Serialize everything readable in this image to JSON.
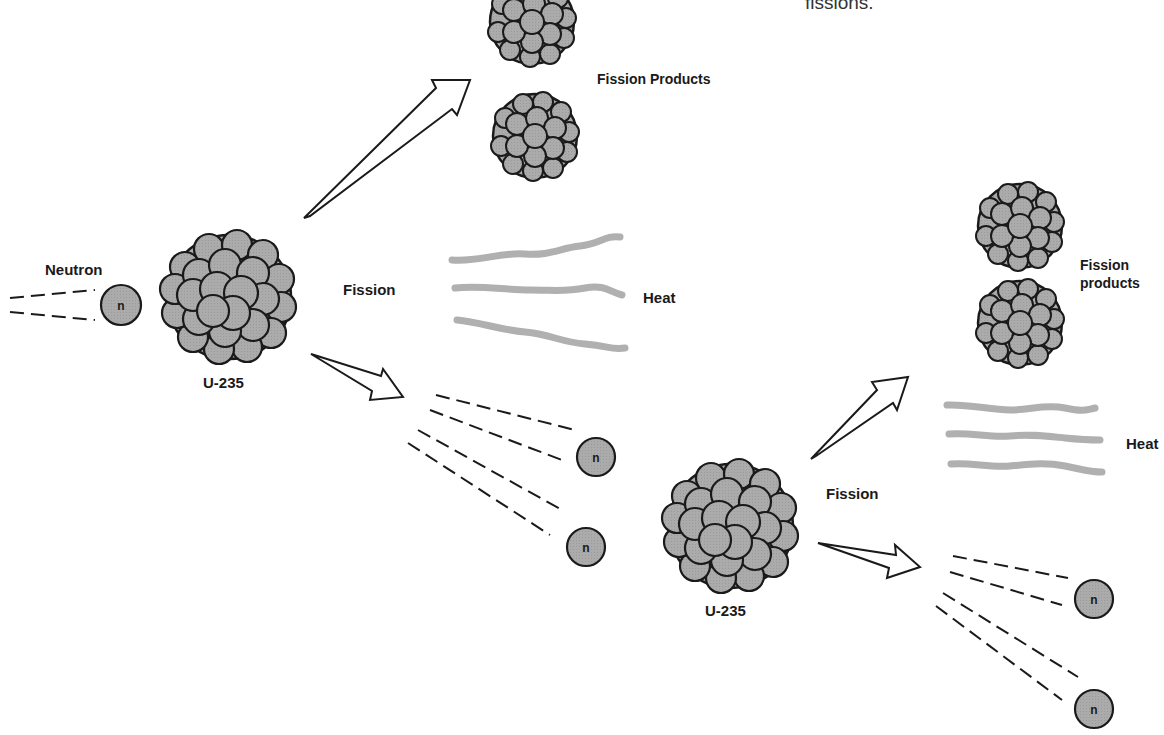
{
  "caption": {
    "text": "fissions."
  },
  "stage1": {
    "neutron_label": "Neutron",
    "neutron_symbol": "n",
    "nucleus_label": "U-235",
    "fission_label": "Fission",
    "products_label": "Fission Products",
    "heat_label": "Heat",
    "released_neutrons": [
      "n",
      "n"
    ]
  },
  "stage2": {
    "nucleus_label": "U-235",
    "fission_label": "Fission",
    "products_label_line1": "Fission",
    "products_label_line2": "products",
    "heat_label": "Heat",
    "released_neutrons": [
      "n",
      "n"
    ]
  },
  "colors": {
    "nucleus_fill": "#a9a9a9",
    "outline": "#1a1a1a",
    "heat_wave": "#b5b5b5",
    "background": "#ffffff"
  }
}
